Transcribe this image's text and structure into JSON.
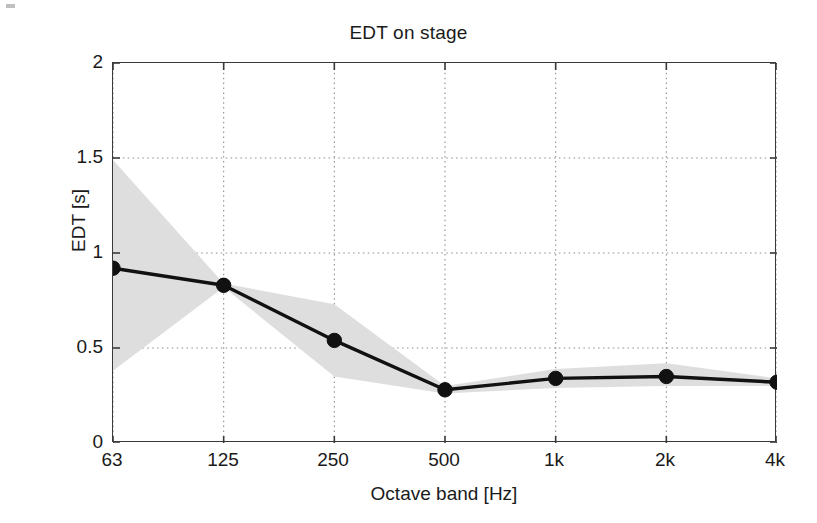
{
  "figure": {
    "title": "EDT on stage",
    "background_color": "#ffffff",
    "axis_color": "#3a3a3a",
    "line_color": "#111111",
    "band_color": "#dcdcdc"
  },
  "chart_data": {
    "type": "line",
    "title": "EDT on stage",
    "xlabel": "Octave band [Hz]",
    "ylabel": "EDT [s]",
    "categories": [
      "63",
      "125",
      "250",
      "500",
      "1k",
      "2k",
      "4k"
    ],
    "x": [
      63,
      125,
      250,
      500,
      1000,
      2000,
      4000
    ],
    "values": [
      0.92,
      0.83,
      0.54,
      0.28,
      0.34,
      0.35,
      0.32
    ],
    "band_upper": [
      1.49,
      0.84,
      0.73,
      0.3,
      0.39,
      0.42,
      0.34
    ],
    "band_lower": [
      0.38,
      0.82,
      0.35,
      0.26,
      0.29,
      0.3,
      0.3
    ],
    "series": [
      {
        "name": "EDT mean",
        "values": [
          0.92,
          0.83,
          0.54,
          0.28,
          0.34,
          0.35,
          0.32
        ],
        "marker": "filled-circle",
        "color": "#111111"
      },
      {
        "name": "EDT spread band",
        "upper": [
          1.49,
          0.84,
          0.73,
          0.3,
          0.39,
          0.42,
          0.34
        ],
        "lower": [
          0.38,
          0.82,
          0.35,
          0.26,
          0.29,
          0.3,
          0.3
        ],
        "color": "#dcdcdc"
      }
    ],
    "xlim": [
      0,
      6
    ],
    "ylim": [
      0,
      2
    ],
    "ytick_labels": [
      "0",
      "0.5",
      "1",
      "1.5",
      "2"
    ],
    "ytick_values": [
      0,
      0.5,
      1,
      1.5,
      2
    ],
    "xtick_labels": [
      "63",
      "125",
      "250",
      "500",
      "1k",
      "2k",
      "4k"
    ],
    "grid": "dotted",
    "grid_x": true,
    "grid_y": true,
    "legend": "none",
    "annotations": []
  },
  "axes": {
    "y_title": "EDT [s]",
    "x_title": "Octave band [Hz]",
    "y_ticks": [
      {
        "label": "2",
        "value": 2
      },
      {
        "label": "1.5",
        "value": 1.5
      },
      {
        "label": "1",
        "value": 1
      },
      {
        "label": "0.5",
        "value": 0.5
      },
      {
        "label": "0",
        "value": 0
      }
    ],
    "x_ticks": [
      {
        "label": "63",
        "index": 0
      },
      {
        "label": "125",
        "index": 1
      },
      {
        "label": "250",
        "index": 2
      },
      {
        "label": "500",
        "index": 3
      },
      {
        "label": "1k",
        "index": 4
      },
      {
        "label": "2k",
        "index": 5
      },
      {
        "label": "4k",
        "index": 6
      }
    ]
  }
}
